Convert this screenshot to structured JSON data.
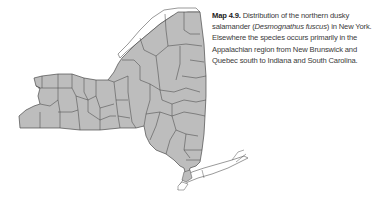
{
  "figure": {
    "map": {
      "region": "New York State",
      "description": "County outline map with all counties shaded gray (species present statewide), Long Island and Lake Ontario shoreline unshaded",
      "colors": {
        "shaded_fill": "#bdbdbd",
        "county_line": "#4a4a4a",
        "unshaded_fill": "#ffffff"
      }
    },
    "caption": {
      "label": "Map 4.9.",
      "text_before_italic": "Distribution of the northern dusky salamander (",
      "scientific_name": "Desmognathus fuscus",
      "text_after_italic": ") in New York. Elsewhere the species occurs primarily in the Appalachian region from New Brunswick and Quebec south to Indiana and South Carolina."
    }
  }
}
